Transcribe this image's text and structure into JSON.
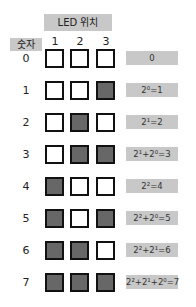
{
  "header": {
    "led_position_label": "LED 위치",
    "number_label": "숫자"
  },
  "columns": [
    "1",
    "2",
    "3"
  ],
  "colors": {
    "on": "#676767",
    "off": "#ffffff",
    "label_bg": "#c8c8c8"
  },
  "rows": [
    {
      "number": "0",
      "leds": [
        0,
        0,
        0
      ],
      "result": "0"
    },
    {
      "number": "1",
      "leds": [
        0,
        0,
        1
      ],
      "result": "2⁰=1"
    },
    {
      "number": "2",
      "leds": [
        0,
        1,
        0
      ],
      "result": "2¹=2"
    },
    {
      "number": "3",
      "leds": [
        0,
        1,
        1
      ],
      "result": "2¹+2⁰=3"
    },
    {
      "number": "4",
      "leds": [
        1,
        0,
        0
      ],
      "result": "2²=4"
    },
    {
      "number": "5",
      "leds": [
        1,
        0,
        1
      ],
      "result": "2²+2⁰=5"
    },
    {
      "number": "6",
      "leds": [
        1,
        1,
        0
      ],
      "result": "2²+2¹=6"
    },
    {
      "number": "7",
      "leds": [
        1,
        1,
        1
      ],
      "result": "2²+2¹+2⁰=7"
    }
  ]
}
